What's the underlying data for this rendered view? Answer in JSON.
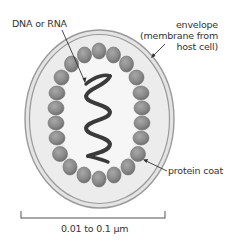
{
  "diagram": {
    "labels": {
      "nucleic_acid": "DNA or RNA",
      "envelope_line1": "envelope",
      "envelope_line2": "(membrane from",
      "envelope_line3": "host cell)",
      "protein_coat": "protein coat",
      "scale": "0.01 to 0.1 µm"
    },
    "colors": {
      "envelope_stroke": "#9a9a9a",
      "envelope_fill": "#e4e4e4",
      "interior_fill": "#f4f4f4",
      "bead_fill": "#8c8c8c",
      "bead_edge": "#6e6e6e",
      "helix": "#3a3a3a",
      "text": "#333333",
      "leader": "#333333",
      "scale_bar": "#555555"
    },
    "components": [
      "envelope",
      "protein coat (capsomere beads)",
      "nucleic acid helix",
      "scale bar"
    ]
  }
}
